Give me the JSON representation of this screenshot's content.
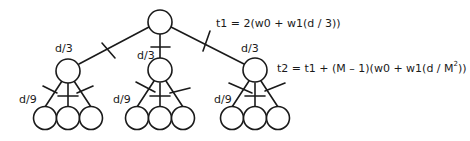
{
  "diagram": {
    "type": "tree",
    "levels": 3,
    "branching_factor": 3,
    "edge_labels": {
      "level1": "d/3",
      "level2": "d/9"
    },
    "formulas": {
      "t1": "t1 = 2(w0 + w1(d / 3))",
      "t2_prefix": "t2 = t1 + (M – 1)(w0 + w1(d / M",
      "t2_sup": "2",
      "t2_suffix": "))"
    },
    "colors": {
      "stroke": "#1a1a1a",
      "fill": "#ffffff"
    }
  }
}
